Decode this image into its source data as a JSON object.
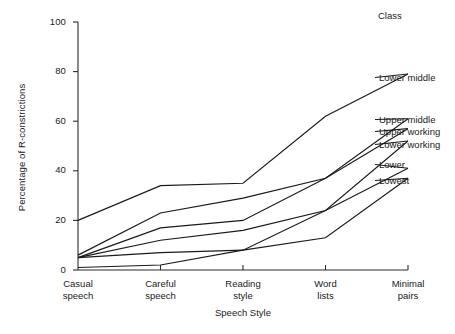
{
  "chart_data": {
    "type": "line",
    "title": "",
    "xlabel": "Speech Style",
    "ylabel": "Percentage of R-constrictions",
    "categories": [
      "Casual speech",
      "Careful speech",
      "Reading style",
      "Word lists",
      "Minimal pairs"
    ],
    "ylim": [
      0,
      100
    ],
    "xlim": [
      0,
      4
    ],
    "yticks": [
      0,
      20,
      40,
      60,
      80,
      100
    ],
    "ytick_labels": [
      "0",
      "20",
      "40",
      "60",
      "80",
      "100"
    ],
    "grid": false,
    "legend_position": "right-inline-labels",
    "legend_title": "Class",
    "series": [
      {
        "name": "Lower middle",
        "values": [
          20,
          34,
          35,
          62,
          79
        ]
      },
      {
        "name": "Upper middle",
        "values": [
          6,
          23,
          29,
          37,
          61
        ]
      },
      {
        "name": "Upper working",
        "values": [
          5,
          17,
          20,
          37,
          57
        ]
      },
      {
        "name": "Lower working",
        "values": [
          5,
          12,
          16,
          24,
          52
        ]
      },
      {
        "name": "Lower",
        "values": [
          5,
          7,
          8,
          24,
          41
        ]
      },
      {
        "name": "Lowest",
        "values": [
          1,
          2,
          8,
          13,
          37
        ]
      }
    ]
  },
  "axes": {
    "y_title": "Percentage of R-constrictions",
    "x_title": "Speech Style",
    "y_tick_labels": [
      "100",
      "80",
      "60",
      "40",
      "20",
      "0"
    ],
    "x_tick_labels": [
      {
        "line1": "Casual",
        "line2": "speech"
      },
      {
        "line1": "Careful",
        "line2": "speech"
      },
      {
        "line1": "Reading",
        "line2": "style"
      },
      {
        "line1": "Word",
        "line2": "lists"
      },
      {
        "line1": "Minimal",
        "line2": "pairs"
      }
    ]
  },
  "legend": {
    "title": "Class",
    "items": [
      {
        "label": "Lower middle"
      },
      {
        "label": "Upper middle"
      },
      {
        "label": "Upper working"
      },
      {
        "label": "Lower working"
      },
      {
        "label": "Lower"
      },
      {
        "label": "Lowest"
      }
    ]
  },
  "colors": {
    "line": "#1a1a1a",
    "axis": "#2b2b2b",
    "background": "#ffffff"
  }
}
